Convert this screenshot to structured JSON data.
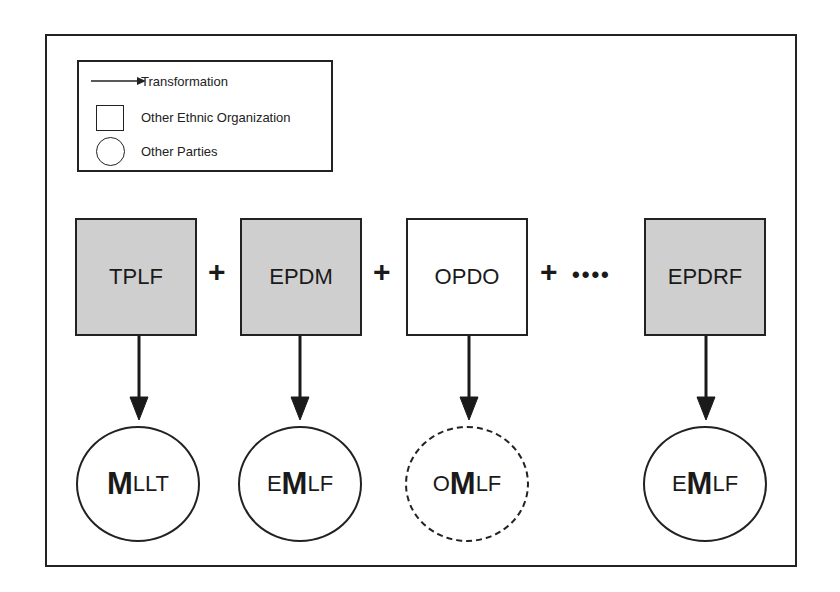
{
  "legend": {
    "items": [
      {
        "icon": "arrow-icon",
        "label": "Transformation"
      },
      {
        "icon": "square-icon",
        "label": "Other Ethnic Organization"
      },
      {
        "icon": "circle-icon",
        "label": "Other Parties"
      }
    ]
  },
  "organizations": [
    {
      "label": "TPLF",
      "shaded": true
    },
    {
      "label": "EPDM",
      "shaded": true
    },
    {
      "label": "OPDO",
      "shaded": false
    },
    {
      "label": "EPDRF",
      "shaded": true
    }
  ],
  "connectors": {
    "plus": "+",
    "dots": "••••"
  },
  "parties": [
    {
      "prefix": "",
      "bold": "M",
      "suffix": "LLT",
      "dashed": false
    },
    {
      "prefix": "E",
      "bold": "M",
      "suffix": "LF",
      "dashed": false
    },
    {
      "prefix": "O",
      "bold": "M",
      "suffix": "LF",
      "dashed": true
    },
    {
      "prefix": "E",
      "bold": "M",
      "suffix": "LF",
      "dashed": false
    }
  ],
  "colors": {
    "shaded_fill": "#cfcfcf",
    "stroke": "#222222"
  }
}
